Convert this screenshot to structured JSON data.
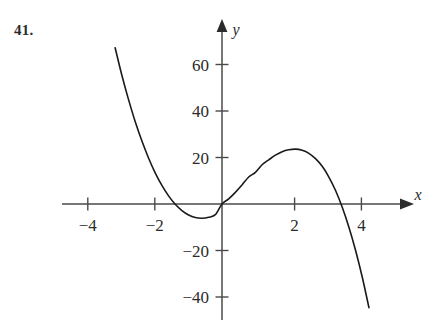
{
  "problem": {
    "number": "41."
  },
  "chart_data": {
    "type": "line",
    "title": "",
    "xlabel": "x",
    "ylabel": "y",
    "grid": false,
    "legend": null,
    "xlim": [
      -4.75,
      5.4
    ],
    "ylim": [
      -50,
      72
    ],
    "x_ticks": [
      -4,
      -2,
      2,
      4
    ],
    "x_tick_labels": [
      "−4",
      "−2",
      "2",
      "4"
    ],
    "y_ticks": [
      60,
      40,
      20,
      -20,
      -40
    ],
    "y_tick_labels": [
      "60",
      "40",
      "20",
      "−20",
      "−40"
    ],
    "function": "y = -2x(x + 1.45)(x - 3.55)",
    "domain_drawn": [
      -3.2,
      4.4
    ],
    "roots": [
      -1.45,
      0,
      3.55
    ],
    "local_minimum": {
      "x": -0.86,
      "y": -5
    },
    "local_maximum": {
      "x": 2.25,
      "y": 23.5
    },
    "x": [
      -3.2,
      -3.0,
      -2.8,
      -2.6,
      -2.4,
      -2.2,
      -2.0,
      -1.8,
      -1.6,
      -1.4,
      -1.2,
      -1.0,
      -0.8,
      -0.6,
      -0.4,
      -0.2,
      0.0,
      0.2,
      0.4,
      0.6,
      0.8,
      1.0,
      1.2,
      1.4,
      1.6,
      1.8,
      2.0,
      2.2,
      2.4,
      2.6,
      2.8,
      3.0,
      3.2,
      3.4,
      3.6,
      3.8,
      4.0,
      4.2,
      4.4
    ],
    "y": [
      67.2,
      55.5,
      45.0,
      35.5,
      27.2,
      19.8,
      13.4,
      8.0,
      3.5,
      -0.1,
      -2.8,
      -4.7,
      -5.8,
      -6.1,
      -5.7,
      -4.6,
      0.0,
      2.2,
      5.0,
      8.2,
      11.6,
      13.6,
      16.9,
      19.0,
      21.0,
      22.5,
      23.3,
      23.6,
      23.1,
      21.8,
      19.5,
      16.2,
      11.6,
      5.8,
      -1.4,
      -10.0,
      -20.0,
      -31.5,
      -44.6
    ],
    "series": [
      {
        "name": "cubic-curve",
        "color": "#1a1a1a",
        "line_width": 1.6
      }
    ],
    "axes": {
      "color": "#4a4a4a",
      "x_axis_arrow": true,
      "y_axis_arrow": true
    }
  },
  "labels": {
    "x_axis": "x",
    "y_axis": "y"
  }
}
